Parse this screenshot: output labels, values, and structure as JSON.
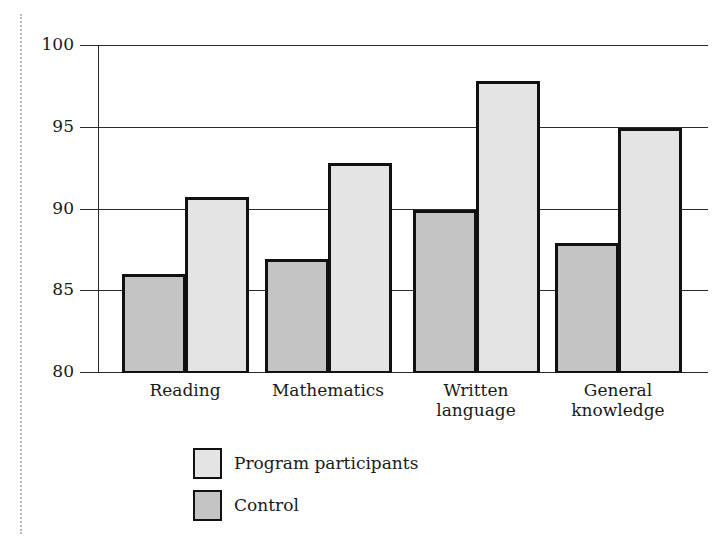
{
  "chart_data": {
    "type": "bar",
    "title": "",
    "xlabel": "",
    "ylabel": "",
    "categories": [
      "Reading",
      "Mathematics",
      "Written\nlanguage",
      "General\nknowledge"
    ],
    "series": [
      {
        "name": "Control",
        "color": "#c4c4c4",
        "values": [
          86.0,
          86.9,
          89.9,
          87.9
        ]
      },
      {
        "name": "Program participants",
        "color": "#e4e4e4",
        "values": [
          90.7,
          92.8,
          97.8,
          94.9
        ]
      }
    ],
    "ylim": [
      80,
      100
    ],
    "yticks": [
      80,
      85,
      90,
      95,
      100
    ],
    "grid": true,
    "legend_position": "bottom-left"
  },
  "legend": {
    "items": [
      {
        "label": "Program participants",
        "color": "#e4e4e4"
      },
      {
        "label": "Control",
        "color": "#c4c4c4"
      }
    ]
  }
}
